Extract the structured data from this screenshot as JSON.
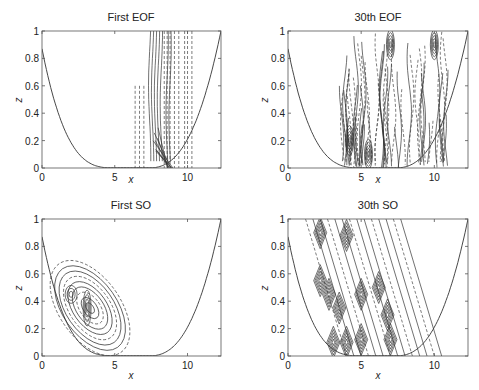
{
  "chart_data": [
    {
      "type": "contour",
      "title": "First EOF",
      "xlabel": "x",
      "ylabel": "z",
      "xlim": [
        0,
        12.3
      ],
      "ylim": [
        0,
        1
      ],
      "xticks": [
        0,
        5,
        10
      ],
      "yticks": [
        0,
        0.2,
        0.4,
        0.6,
        0.8,
        1
      ],
      "ytick_labels": [
        "0",
        "0.2",
        "0.4",
        "0.6",
        "0.8",
        "1"
      ],
      "bathymetry": "valley curve from z=0.87 at x=0 down to ~0 near x=5-8, up to z=1 at x=12.3",
      "contours": {
        "solid_bands_x": [
          7.4,
          7.6,
          7.8,
          8.0,
          8.2,
          8.6,
          8.8
        ],
        "dashed_bands_x": [
          6.4,
          6.7,
          7.0,
          8.4,
          8.6,
          8.8,
          9.1,
          9.4,
          9.8,
          10.0,
          10.3
        ],
        "region": "x 6-10.5, full depth; vertical stripes"
      }
    },
    {
      "type": "contour",
      "title": "30th EOF",
      "xlabel": "x",
      "ylabel": "z",
      "xlim": [
        0,
        12.3
      ],
      "ylim": [
        0,
        1
      ],
      "xticks": [
        0,
        5,
        10
      ],
      "yticks": [
        0,
        0.2,
        0.4,
        0.6,
        0.8,
        1
      ],
      "ytick_labels": [
        "0",
        "0.2",
        "0.4",
        "0.6",
        "0.8",
        "1"
      ],
      "contours": {
        "region": "x 3.5-10.8, full depth; dense vertical stripes with dark cores near x=4.2, 7.0, 10"
      }
    },
    {
      "type": "contour",
      "title": "First SO",
      "xlabel": "x",
      "ylabel": "z",
      "xlim": [
        0,
        12.3
      ],
      "ylim": [
        0,
        1
      ],
      "xticks": [
        0,
        5,
        10
      ],
      "yticks": [
        0,
        0.2,
        0.4,
        0.6,
        0.8,
        1
      ],
      "ytick_labels": [
        "0",
        "0.2",
        "0.4",
        "0.6",
        "0.8",
        "1"
      ],
      "contours": {
        "center": [
          3.0,
          0.35
        ],
        "region": "tilted elliptical blob x 1.2-5.8, z 0.05-0.67"
      }
    },
    {
      "type": "contour",
      "title": "30th SO",
      "xlabel": "x",
      "ylabel": "z",
      "xlim": [
        0,
        12.3
      ],
      "ylim": [
        0,
        1
      ],
      "xticks": [
        0,
        5,
        10
      ],
      "yticks": [
        0,
        0.2,
        0.4,
        0.6,
        0.8,
        1
      ],
      "ytick_labels": [
        "0",
        "0.2",
        "0.4",
        "0.6",
        "0.8",
        "1"
      ],
      "contours": {
        "region": "slanted band x 1-8.3, full depth; diamond-shaped cores",
        "cores": [
          [
            2.2,
            0.9
          ],
          [
            4.0,
            0.88
          ],
          [
            2.2,
            0.55
          ],
          [
            2.8,
            0.45
          ],
          [
            5.0,
            0.45
          ],
          [
            6.2,
            0.5
          ],
          [
            3.5,
            0.35
          ],
          [
            6.8,
            0.3
          ],
          [
            3.1,
            0.1
          ],
          [
            4.0,
            0.1
          ],
          [
            5.0,
            0.12
          ],
          [
            7.0,
            0.12
          ]
        ]
      }
    }
  ],
  "panels": [
    {
      "title": "First EOF",
      "xlabel": "x",
      "ylabel": "z"
    },
    {
      "title": "30th EOF",
      "xlabel": "x",
      "ylabel": "z"
    },
    {
      "title": "First SO",
      "xlabel": "x",
      "ylabel": "z"
    },
    {
      "title": "30th SO",
      "xlabel": "x",
      "ylabel": "z"
    }
  ]
}
